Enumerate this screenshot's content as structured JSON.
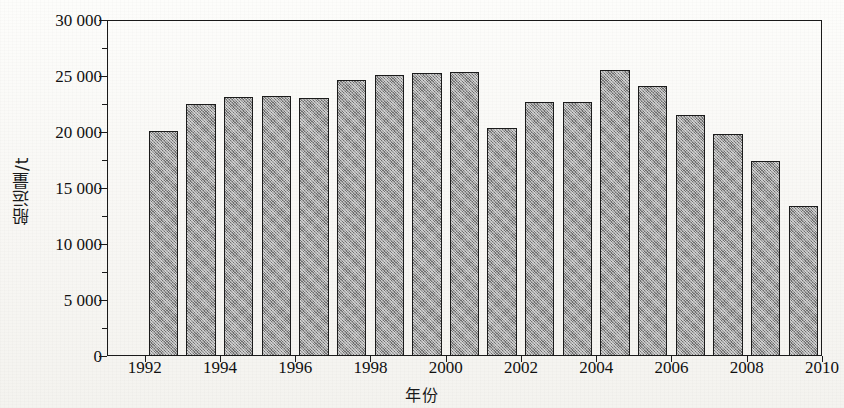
{
  "chart_data": {
    "type": "bar",
    "title": "",
    "subtitle": "",
    "xlabel": "年份",
    "ylabel": "船运量/t",
    "categories": [
      1992,
      1993,
      1994,
      1995,
      1996,
      1997,
      1998,
      1999,
      2000,
      2001,
      2002,
      2003,
      2004,
      2005,
      2006,
      2007,
      2008,
      2009
    ],
    "values": [
      20100,
      22500,
      23100,
      23200,
      23000,
      24600,
      25100,
      25300,
      25350,
      20350,
      22700,
      22700,
      25550,
      24150,
      21550,
      19850,
      17400,
      13350
    ],
    "series": [
      {
        "name": "船运量/t",
        "values": [
          20100,
          22500,
          23100,
          23200,
          23000,
          24600,
          25100,
          25300,
          25350,
          20350,
          22700,
          22700,
          25550,
          24150,
          21550,
          19850,
          17400,
          13350
        ]
      }
    ],
    "xlim": [
      1991,
      2010
    ],
    "ylim": [
      0,
      30000
    ],
    "y_ticks": [
      0,
      5000,
      10000,
      15000,
      20000,
      25000,
      30000
    ],
    "y_tick_labels": [
      "0",
      "5 000",
      "10 000",
      "15 000",
      "20 000",
      "25 000",
      "30 000"
    ],
    "y_minor_ticks": [
      2500,
      7500,
      12500,
      17500,
      22500,
      27500
    ],
    "x_ticks": [
      1992,
      1994,
      1996,
      1998,
      2000,
      2002,
      2004,
      2006,
      2008,
      2010
    ],
    "x_tick_labels": [
      "1992",
      "1994",
      "1996",
      "1998",
      "2000",
      "2002",
      "2004",
      "2006",
      "2008",
      "2010"
    ],
    "grid": false,
    "legend": false,
    "legend_position": "none",
    "bar_fill_color": "#9a9a9a",
    "bar_edge_color": "#1b1b1b",
    "axis_color": "#1a1a1a",
    "background_color": "#fbfaf7",
    "bar_fill_pattern": "cross-hatch-dither"
  }
}
